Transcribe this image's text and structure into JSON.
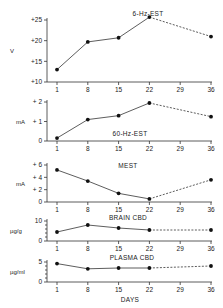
{
  "chart_data": [
    {
      "type": "line",
      "title": "6-Hz-EST",
      "xlabel": "",
      "ylabel": "V",
      "x": [
        1,
        8,
        15,
        22,
        36
      ],
      "x_ticks": [
        1,
        8,
        15,
        22,
        29,
        36
      ],
      "y_ticks": [
        "+10",
        "+15",
        "+20",
        "+25"
      ],
      "ylim": [
        10,
        25
      ],
      "values": [
        13,
        19.7,
        20.7,
        25.7,
        21
      ],
      "solid_until_x": 22,
      "dashed_from_x": 22,
      "layout": {
        "top": 20,
        "bottom": 82,
        "title_x": 148,
        "title_y": 16
      }
    },
    {
      "type": "line",
      "title": "60-Hz-EST",
      "xlabel": "",
      "ylabel": "mA",
      "x": [
        1,
        8,
        15,
        22,
        36
      ],
      "x_ticks": [
        1,
        8,
        15,
        22,
        29,
        36
      ],
      "y_ticks": [
        "0",
        "+ 1",
        "+ 2"
      ],
      "ylim": [
        0,
        2
      ],
      "values": [
        0.15,
        1.1,
        1.3,
        1.95,
        1.25
      ],
      "solid_until_x": 22,
      "dashed_from_x": 22,
      "layout": {
        "top": 102,
        "bottom": 141,
        "title_x": 130,
        "title_y": 136
      }
    },
    {
      "type": "line",
      "title": "MEST",
      "xlabel": "",
      "ylabel": "mA",
      "x": [
        1,
        8,
        15,
        22,
        36
      ],
      "x_ticks": [
        1,
        8,
        15,
        22,
        29,
        36
      ],
      "y_ticks": [
        "0",
        "+ 2",
        "+ 4",
        "+ 6"
      ],
      "ylim": [
        0,
        6
      ],
      "values": [
        5.2,
        3.4,
        1.4,
        0.5,
        3.6
      ],
      "solid_until_x": 22,
      "dashed_from_x": 22,
      "layout": {
        "top": 165,
        "bottom": 202,
        "title_x": 128,
        "title_y": 168
      }
    },
    {
      "type": "line",
      "title": "BRAIN CBD",
      "xlabel": "",
      "ylabel": "µg/g",
      "x": [
        1,
        8,
        15,
        22,
        36
      ],
      "x_ticks": [
        1,
        8,
        15,
        22,
        29,
        36
      ],
      "y_ticks": [
        "0",
        "10"
      ],
      "ylim": [
        0,
        10
      ],
      "values": [
        4.5,
        8,
        6.5,
        5.5,
        5.5
      ],
      "solid_until_x": 22,
      "dashed_from_x": 22,
      "layout": {
        "top": 221,
        "bottom": 241,
        "title_x": 128,
        "title_y": 220
      }
    },
    {
      "type": "line",
      "title": "PLASMA CBD",
      "xlabel": "DAYS",
      "ylabel": "µg/ml",
      "x": [
        1,
        8,
        15,
        22,
        36
      ],
      "x_ticks": [
        1,
        8,
        15,
        22,
        29,
        36
      ],
      "y_ticks": [
        "0",
        "5"
      ],
      "ylim": [
        0,
        5
      ],
      "values": [
        4.6,
        3.3,
        3.5,
        3.5,
        4
      ],
      "solid_until_x": 22,
      "dashed_from_x": 22,
      "layout": {
        "top": 262,
        "bottom": 282,
        "title_x": 132,
        "title_y": 260
      }
    }
  ],
  "x_axis": {
    "label": "DAYS",
    "tick_labels": [
      "1",
      "8",
      "15",
      "22",
      "29",
      "36"
    ]
  }
}
